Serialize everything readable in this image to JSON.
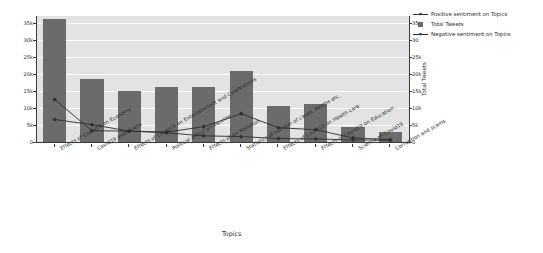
{
  "chart_data": {
    "type": "bar",
    "title": "",
    "xlabel": "Topics",
    "ylabel_left": "",
    "ylabel_right": "Total Tweets",
    "grid": true,
    "legend_position": "upper right",
    "ylim_left": [
      0,
      37000
    ],
    "ylim_right": [
      0,
      37000
    ],
    "yticks_left": [
      "0",
      "5k",
      "10k",
      "15k",
      "20k",
      "25k",
      "30k",
      "35k"
    ],
    "ytick_values_left": [
      0,
      5000,
      10000,
      15000,
      20000,
      25000,
      30000,
      35000
    ],
    "yticks_right": [
      "0",
      "5k",
      "10k",
      "15k",
      "20k",
      "25k",
      "30",
      "35"
    ],
    "ytick_values_right": [
      0,
      5000,
      10000,
      15000,
      20000,
      25000,
      30000,
      35000
    ],
    "categories": [
      "Effects of Covid19 on Economy",
      "Covid19 awareness",
      "Effects of Covid19 on Entertainment and Celebrations",
      "Political effect on Vaccine",
      "Effects of Air Pollution",
      "Statistics of number of cases, deaths etc.",
      "Effects of Covid19 on Health care",
      "Effects of Covid19 on Education",
      "Science on Covid19",
      "Corruption and scams"
    ],
    "series": [
      {
        "name": "Total Tweets",
        "type": "bar",
        "color": "#6b6b6b",
        "values": [
          36000,
          18500,
          15000,
          16300,
          16200,
          21000,
          10600,
          11200,
          4300,
          2800
        ]
      },
      {
        "name": "Positive sentiment on Topics",
        "type": "line",
        "color": "#2f2f2f",
        "values": [
          12500,
          3300,
          3200,
          2900,
          4500,
          8300,
          4200,
          3600,
          1200,
          700
        ]
      },
      {
        "name": "Negative sentiment on Topics",
        "type": "line",
        "color": "#2f2f2f",
        "values": [
          6600,
          5100,
          3200,
          2700,
          1800,
          1600,
          1000,
          900,
          600,
          500
        ]
      }
    ],
    "legend": [
      "Positive sentiment on Topics",
      "Total Tweets",
      "Negative sentiment on Topics"
    ]
  },
  "colors": {
    "bar": "#6b6b6b",
    "line": "#2f2f2f",
    "plot_background": "#e3e3e3",
    "gridline": "#ffffff",
    "figure_background": "#ffffff",
    "text": "#2b2b2b"
  }
}
